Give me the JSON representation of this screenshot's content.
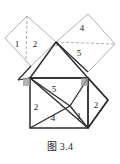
{
  "figure": {
    "caption": "图 3.4",
    "colors": {
      "solid_stroke": "#2b2b2b",
      "dashed_stroke": "#9a9a9a",
      "light_stroke": "#a8a8a8",
      "right_angle_fill": "#8e8e8e",
      "label_text": "#1a1a1a",
      "background": "#ffffff"
    },
    "regions": [
      {
        "id": "region-1-left-square",
        "label": "1",
        "x": 17,
        "y": 45
      },
      {
        "id": "region-2-left-square",
        "label": "2",
        "x": 35,
        "y": 45
      },
      {
        "id": "region-3-apex",
        "label": "3",
        "x": 55,
        "y": 44
      },
      {
        "id": "region-4-upper-right-square",
        "label": "4",
        "x": 82,
        "y": 29
      },
      {
        "id": "region-5-upper-right-square",
        "label": "5",
        "x": 79,
        "y": 54
      },
      {
        "id": "region-5-main-square",
        "label": "5",
        "x": 54,
        "y": 90
      },
      {
        "id": "region-2-main-left",
        "label": "2",
        "x": 36,
        "y": 108
      },
      {
        "id": "region-4-main-bottom",
        "label": "4",
        "x": 53,
        "y": 119
      },
      {
        "id": "region-1-main-right",
        "label": "1",
        "x": 79,
        "y": 117
      },
      {
        "id": "region-2-right-outer",
        "label": "2",
        "x": 95,
        "y": 106
      }
    ]
  }
}
